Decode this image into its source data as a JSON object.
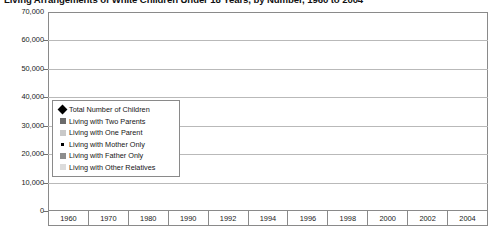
{
  "chart_title": "Living Arrangements of White Children Under 18 Years, by Number, 1960 to 2004",
  "legend": {
    "items": [
      {
        "label": "Total Number of Children",
        "marker": "diamond-marker",
        "color": "#000000"
      },
      {
        "label": "Living with Two Parents",
        "marker": "square-marker",
        "color": "#6b6b6b"
      },
      {
        "label": "Living with One Parent",
        "marker": "square-marker",
        "color": "#c9c9c9"
      },
      {
        "label": "Living with Mother Only",
        "marker": "small-square-marker",
        "color": "#000000"
      },
      {
        "label": "Living with Father Only",
        "marker": "square-marker",
        "color": "#8d8d8d"
      },
      {
        "label": "Living with Other Relatives",
        "marker": "square-marker",
        "color": "#dcdcdc"
      }
    ]
  },
  "axis": {
    "y_ticks": [
      "70,000",
      "60,000",
      "50,000",
      "40,000",
      "30,000",
      "20,000",
      "10,000",
      "0"
    ],
    "y_tick_values": [
      70000,
      60000,
      50000,
      40000,
      30000,
      20000,
      10000,
      0
    ],
    "x_ticks": [
      "1960",
      "1970",
      "1980",
      "1990",
      "1992",
      "1994",
      "1996",
      "1998",
      "2000",
      "2002",
      "2004"
    ]
  },
  "chart_data": {
    "type": "line",
    "title": "Living Arrangements of White Children Under 18 Years, by Number, 1960 to 2004",
    "xlabel": "",
    "ylabel": "",
    "ylim": [
      0,
      70000
    ],
    "grid": true,
    "legend_position": "inside-left",
    "categories": [
      "1960",
      "1970",
      "1980",
      "1990",
      "1992",
      "1994",
      "1996",
      "1998",
      "2000",
      "2002",
      "2004"
    ],
    "series": [
      {
        "name": "Total Number of Children",
        "color": "#000000",
        "marker": "diamond",
        "values": [
          55500,
          58800,
          52200,
          51400,
          52000,
          53100,
          54100,
          55300,
          56200,
          56600,
          56600
        ]
      },
      {
        "name": "Living with Two Parents",
        "color": "#6b6b6b",
        "marker": "square",
        "values": [
          49800,
          52300,
          42200,
          41000,
          40800,
          41100,
          41500,
          42200,
          42900,
          42100,
          41900
        ]
      },
      {
        "name": "Living with One Parent",
        "color": "#c9c9c9",
        "marker": "square",
        "values": [
          3900,
          5100,
          7900,
          9500,
          10100,
          10600,
          11100,
          11600,
          11900,
          12000,
          12300
        ]
      },
      {
        "name": "Living with Mother Only",
        "color": "#000000",
        "marker": "small-square",
        "values": [
          3500,
          4600,
          7100,
          8400,
          8700,
          9000,
          9300,
          9600,
          9700,
          9700,
          9700
        ]
      },
      {
        "name": "Living with Father Only",
        "color": "#8d8d8d",
        "marker": "square",
        "values": [
          600,
          600,
          900,
          1300,
          1500,
          1700,
          1900,
          2100,
          2300,
          2400,
          2500
        ]
      },
      {
        "name": "Living with Other Relatives",
        "color": "#dcdcdc",
        "marker": "square",
        "values": [
          1000,
          1000,
          1200,
          1300,
          1300,
          1400,
          1400,
          1400,
          1400,
          1400,
          1400
        ]
      }
    ]
  }
}
